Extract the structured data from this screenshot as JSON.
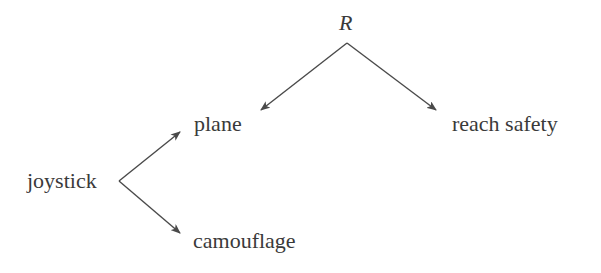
{
  "diagram": {
    "type": "tree",
    "nodes": {
      "root": {
        "label": "R"
      },
      "plane": {
        "label": "plane"
      },
      "reach_safety": {
        "label": "reach safety"
      },
      "joystick": {
        "label": "joystick"
      },
      "camouflage": {
        "label": "camouflage"
      }
    },
    "edges": [
      {
        "from": "R",
        "to": "plane"
      },
      {
        "from": "R",
        "to": "reach safety"
      },
      {
        "from": "joystick",
        "to": "plane"
      },
      {
        "from": "joystick",
        "to": "camouflage"
      }
    ],
    "colors": {
      "line": "#4a4a4a",
      "text": "#3a3a3a",
      "background": "#ffffff"
    }
  }
}
